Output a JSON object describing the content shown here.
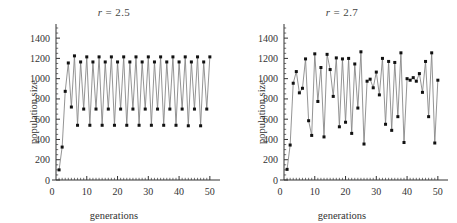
{
  "figure": {
    "background": "#ffffff",
    "line_color": "#888888",
    "marker_color": "#111111",
    "axis_color": "#333333"
  },
  "chart_data": [
    {
      "type": "line",
      "title": "r = 2.5",
      "title_var": "r",
      "title_rest": " = 2.5",
      "xlabel": "generations",
      "ylabel": "population size",
      "xlim": [
        0,
        52
      ],
      "ylim": [
        0,
        1500
      ],
      "xticks": [
        0,
        10,
        20,
        30,
        40,
        50
      ],
      "yticks": [
        0,
        200,
        400,
        600,
        800,
        1000,
        1200,
        1400
      ],
      "grid": false,
      "legend": "none",
      "x": [
        1,
        2,
        3,
        4,
        5,
        6,
        7,
        8,
        9,
        10,
        11,
        12,
        13,
        14,
        15,
        16,
        17,
        18,
        19,
        20,
        21,
        22,
        23,
        24,
        25,
        26,
        27,
        28,
        29,
        30,
        31,
        32,
        33,
        34,
        35,
        36,
        37,
        38,
        39,
        40,
        41,
        42,
        43,
        44,
        45,
        46,
        47,
        48,
        49,
        50
      ],
      "values": [
        100,
        325,
        875,
        1155,
        720,
        1225,
        540,
        1165,
        700,
        1215,
        540,
        1165,
        700,
        1215,
        540,
        1165,
        700,
        1215,
        540,
        1165,
        700,
        1215,
        540,
        1165,
        700,
        1215,
        540,
        1165,
        700,
        1215,
        540,
        1165,
        700,
        1215,
        540,
        1165,
        700,
        1215,
        540,
        1165,
        700,
        1215,
        535,
        1165,
        700,
        1215,
        535,
        1165,
        700,
        1215
      ]
    },
    {
      "type": "line",
      "title": "r = 2.7",
      "title_var": "r",
      "title_rest": " = 2.7",
      "xlabel": "generations",
      "ylabel": "population size",
      "xlim": [
        0,
        52
      ],
      "ylim": [
        0,
        1500
      ],
      "xticks": [
        0,
        10,
        20,
        30,
        40,
        50
      ],
      "yticks": [
        0,
        200,
        400,
        600,
        800,
        1000,
        1200,
        1400
      ],
      "grid": false,
      "legend": "none",
      "x": [
        1,
        2,
        3,
        4,
        5,
        6,
        7,
        8,
        9,
        10,
        11,
        12,
        13,
        14,
        15,
        16,
        17,
        18,
        19,
        20,
        21,
        22,
        23,
        24,
        25,
        26,
        27,
        28,
        29,
        30,
        31,
        32,
        33,
        34,
        35,
        36,
        37,
        38,
        39,
        40,
        41,
        42,
        43,
        44,
        45,
        46,
        47,
        48,
        49,
        50
      ],
      "values": [
        105,
        345,
        955,
        1070,
        860,
        905,
        1195,
        585,
        440,
        1245,
        775,
        1110,
        425,
        1240,
        1090,
        825,
        1205,
        525,
        1195,
        570,
        1200,
        460,
        1145,
        710,
        1265,
        355,
        975,
        995,
        910,
        1065,
        840,
        1200,
        550,
        1170,
        490,
        1160,
        625,
        1255,
        370,
        1000,
        985,
        1010,
        975,
        1050,
        865,
        1170,
        625,
        1255,
        365,
        985
      ]
    }
  ]
}
